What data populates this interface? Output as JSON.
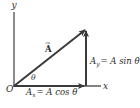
{
  "diagram": {
    "axes": {
      "x_label": "x",
      "y_label": "y",
      "origin_label": "O"
    },
    "vector": {
      "label": "A",
      "arrow_accent": "→"
    },
    "angle_label": "θ",
    "components": {
      "x_component": {
        "symbol": "A",
        "subscript": "x",
        "equation": "= A cos θ"
      },
      "y_component": {
        "symbol": "A",
        "subscript": "y",
        "equation": "= A sin θ"
      }
    },
    "colors": {
      "line": "#3a3a3a",
      "text": "#2a2a2a",
      "background": "#ffffff"
    }
  }
}
